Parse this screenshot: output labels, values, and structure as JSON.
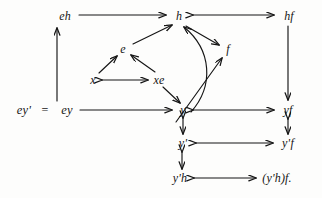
{
  "figure": {
    "type": "commutative-diagram",
    "background_color": "#fdfdfc",
    "ink_color": "#151515"
  },
  "nodes": [
    {
      "id": "eh",
      "label": "eh",
      "x": 65,
      "y": 16
    },
    {
      "id": "h",
      "label": "h",
      "x": 179,
      "y": 16
    },
    {
      "id": "hf",
      "label": "hf",
      "x": 289,
      "y": 16
    },
    {
      "id": "e",
      "label": "e",
      "x": 123,
      "y": 49
    },
    {
      "id": "f",
      "label": "f",
      "x": 228,
      "y": 49
    },
    {
      "id": "x",
      "label": "x",
      "x": 93,
      "y": 80
    },
    {
      "id": "xe",
      "label": "xe",
      "x": 159,
      "y": 80
    },
    {
      "id": "eyp",
      "label": "ey'",
      "x": 24,
      "y": 110
    },
    {
      "id": "ey",
      "label": "ey",
      "x": 67,
      "y": 110
    },
    {
      "id": "y",
      "label": "y",
      "x": 183,
      "y": 110
    },
    {
      "id": "yf",
      "label": "yf",
      "x": 288,
      "y": 110
    },
    {
      "id": "yp",
      "label": "y'",
      "x": 183,
      "y": 143
    },
    {
      "id": "ypf",
      "label": "y'f",
      "x": 288,
      "y": 143
    },
    {
      "id": "yph",
      "label": "y'h",
      "x": 180,
      "y": 178
    },
    {
      "id": "ypfh",
      "label": "(y'h)f.",
      "x": 277,
      "y": 178
    }
  ],
  "equality": {
    "symbol": "=",
    "x": 45,
    "y": 110
  },
  "edges": [
    {
      "from": "ey",
      "to": "eh",
      "kind": "single-up",
      "note": "vertical arrow up left side"
    },
    {
      "from": "eh",
      "to": "h",
      "kind": "single-right",
      "note": "top horizontal arrow"
    },
    {
      "from": "h",
      "to": "hf",
      "kind": "double-horizontal",
      "note": "top right double arrow"
    },
    {
      "from": "e",
      "to": "h",
      "kind": "single-up-right",
      "note": "diagonal from e to h"
    },
    {
      "from": "h",
      "to": "f",
      "kind": "single-down-right",
      "note": "short diagonal h to f"
    },
    {
      "from": "x",
      "to": "e",
      "kind": "single-up-right",
      "note": "x up to e"
    },
    {
      "from": "xe",
      "to": "e",
      "kind": "single-up-left",
      "note": "xe up to e"
    },
    {
      "from": "x",
      "to": "xe",
      "kind": "double-horizontal",
      "note": "x double arrow xe"
    },
    {
      "from": "xe",
      "to": "y",
      "kind": "single-down-right",
      "note": "xe down to y"
    },
    {
      "from": "ey",
      "to": "y",
      "kind": "single-right",
      "note": "middle horizontal arrow"
    },
    {
      "from": "y",
      "to": "yf",
      "kind": "double-horizontal",
      "note": "middle right double arrow"
    },
    {
      "from": "y",
      "to": "h",
      "kind": "curved-up",
      "note": "long curved arrow y to h"
    },
    {
      "from": "y",
      "to": "f",
      "kind": "single-up-right",
      "note": "diagonal from near y to f"
    },
    {
      "from": "hf",
      "to": "yf",
      "kind": "single-down",
      "note": "right vertical arrow"
    },
    {
      "from": "yf",
      "to": "ypf",
      "kind": "double-vertical",
      "note": "right vertical double arrow"
    },
    {
      "from": "y",
      "to": "yp",
      "kind": "double-vertical",
      "note": "y double arrow y'"
    },
    {
      "from": "yp",
      "to": "ypf",
      "kind": "double-horizontal",
      "note": "y' double arrow y'f"
    },
    {
      "from": "yp",
      "to": "yph",
      "kind": "double-vertical",
      "note": "y' double arrow y'h"
    },
    {
      "from": "yph",
      "to": "ypfh",
      "kind": "double-horizontal",
      "note": "bottom double arrow"
    }
  ]
}
